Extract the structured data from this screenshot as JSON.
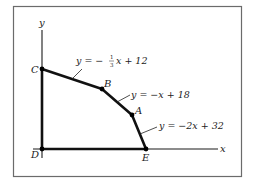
{
  "figure": {
    "frame": {
      "x": 13,
      "y": 6,
      "w": 228,
      "h": 170,
      "stroke": "#6b6b6b"
    },
    "axes": {
      "y_label": "y",
      "x_label": "x",
      "origin": {
        "x": 42,
        "y": 149
      },
      "y_top": 30,
      "x_right": 218,
      "color": "#1a1a1a"
    },
    "points": [
      {
        "id": "C",
        "label": "C",
        "x": 42,
        "y": 69
      },
      {
        "id": "B",
        "label": "B",
        "x": 102,
        "y": 89
      },
      {
        "id": "A",
        "label": "A",
        "x": 132,
        "y": 115
      },
      {
        "id": "E",
        "label": "E",
        "x": 146,
        "y": 149
      },
      {
        "id": "D",
        "label": "D",
        "x": 42,
        "y": 149
      }
    ],
    "equations": [
      {
        "id": "eq-CB",
        "prefix": "y = −",
        "frac_num": "1",
        "frac_den": "3",
        "suffix": "x + 12",
        "segment": "C-B"
      },
      {
        "id": "eq-BA",
        "text": "y = −x + 18",
        "segment": "B-A"
      },
      {
        "id": "eq-AE",
        "text": "y = −2x + 32",
        "segment": "A-E"
      }
    ]
  }
}
